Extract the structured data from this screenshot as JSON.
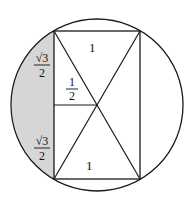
{
  "diagram": {
    "colors": {
      "stroke": "#1a1a1a",
      "shade": "#d6d6d6",
      "background": "#ffffff"
    },
    "labels": {
      "top_side": "1",
      "bottom_side": "1",
      "half_segment_num": "1",
      "half_segment_den": "2",
      "upper_left_num": "√3",
      "upper_left_den": "2",
      "lower_left_num": "√3",
      "lower_left_den": "2"
    }
  }
}
